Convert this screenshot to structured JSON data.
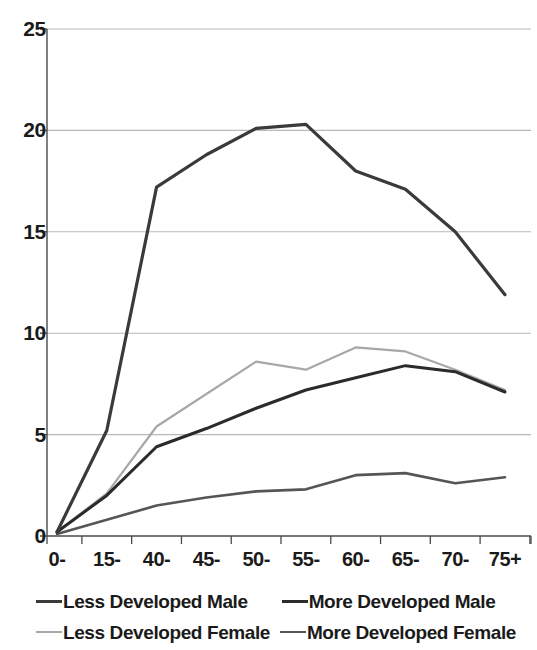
{
  "chart_data": {
    "type": "line",
    "title": "",
    "subtitle": "",
    "xlabel": "",
    "ylabel": "",
    "categories": [
      "0-",
      "15-",
      "40-",
      "45-",
      "50-",
      "55-",
      "60-",
      "65-",
      "70-",
      "75+"
    ],
    "ylim": [
      0,
      25
    ],
    "yticks": [
      "0",
      "5",
      "10",
      "15",
      "20",
      "25"
    ],
    "ytick_values": [
      0,
      5,
      10,
      15,
      20,
      25
    ],
    "grid": "horizontal",
    "legend_position": "bottom",
    "series": [
      {
        "name": "Less Developed Male",
        "color": "#3a3a3a",
        "width": 3.2,
        "values": [
          0.2,
          5.2,
          17.2,
          18.8,
          20.1,
          20.3,
          18.0,
          17.1,
          15.0,
          11.9
        ]
      },
      {
        "name": "More Developed Male",
        "color": "#2b2b2b",
        "width": 3.0,
        "values": [
          0.2,
          2.0,
          4.4,
          5.3,
          6.3,
          7.2,
          7.8,
          8.4,
          8.1,
          7.1
        ]
      },
      {
        "name": "Less Developed Female",
        "color": "#a8a8a8",
        "width": 2.2,
        "values": [
          0.2,
          2.1,
          5.4,
          7.0,
          8.6,
          8.2,
          9.3,
          9.1,
          8.2,
          7.2
        ]
      },
      {
        "name": "More Developed Female",
        "color": "#555555",
        "width": 2.6,
        "values": [
          0.1,
          0.8,
          1.5,
          1.9,
          2.2,
          2.3,
          3.0,
          3.1,
          2.6,
          2.9
        ]
      }
    ],
    "legend_order": [
      {
        "series": "Less Developed Male",
        "row": 0,
        "col": 0
      },
      {
        "series": "More Developed Male",
        "row": 0,
        "col": 1
      },
      {
        "series": "Less Developed Female",
        "row": 1,
        "col": 0
      },
      {
        "series": "More Developed Female",
        "row": 1,
        "col": 1
      }
    ],
    "axis_color": "#4a4a4a",
    "grid_color": "#b9b9b9"
  }
}
